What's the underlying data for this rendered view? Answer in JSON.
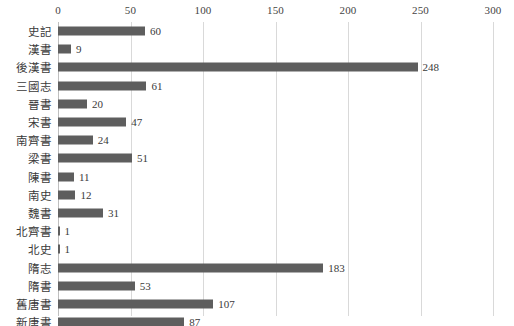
{
  "chart_data": {
    "type": "bar",
    "orientation": "horizontal",
    "title": "",
    "subtitle": "",
    "xlabel": "",
    "ylabel": "",
    "xlim": [
      0,
      300
    ],
    "ylim": null,
    "grid": true,
    "grid_axis": "x",
    "legend": false,
    "legend_position": "none",
    "xticks": [
      0,
      50,
      100,
      150,
      200,
      250,
      300
    ],
    "xtick_labels": [
      "0",
      "50",
      "100",
      "150",
      "200",
      "250",
      "300"
    ],
    "categories": [
      "史記",
      "漢書",
      "後漢書",
      "三國志",
      "晉書",
      "宋書",
      "南齊書",
      "梁書",
      "陳書",
      "南史",
      "魏書",
      "北齊書",
      "北史",
      "隋志",
      "隋書",
      "舊唐書",
      "新唐書"
    ],
    "values": [
      60,
      9,
      248,
      61,
      20,
      47,
      24,
      51,
      11,
      12,
      31,
      1,
      1,
      183,
      53,
      107,
      87
    ],
    "data_labels": [
      "60",
      "9",
      "248",
      "61",
      "20",
      "47",
      "24",
      "51",
      "11",
      "12",
      "31",
      "1",
      "1",
      "183",
      "53",
      "107",
      "87"
    ],
    "series": [
      {
        "name": "",
        "values": [
          60,
          9,
          248,
          61,
          20,
          47,
          24,
          51,
          11,
          12,
          31,
          1,
          1,
          183,
          53,
          107,
          87
        ],
        "color": "#5e5e5e"
      }
    ]
  },
  "style": {
    "bar_color": "#5e5e5e",
    "grid_color": "#d9d9d9",
    "axis_color": "#bfbfbf",
    "text_color": "#3a3a3a",
    "background": "#ffffff"
  }
}
